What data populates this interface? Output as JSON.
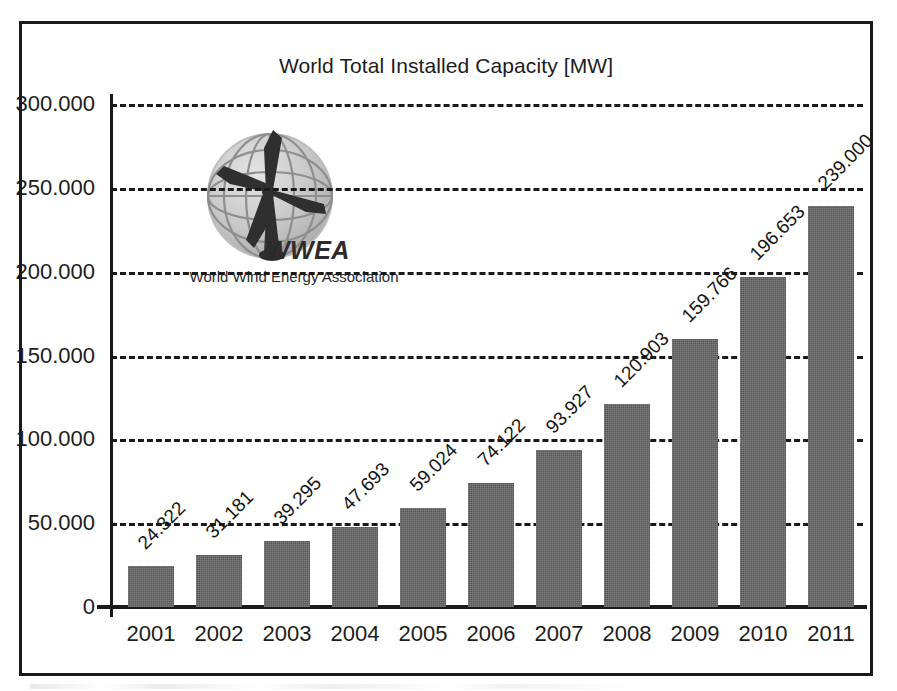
{
  "chart_data": {
    "type": "bar",
    "title": "World Total Installed Capacity [MW]",
    "xlabel": "",
    "ylabel": "",
    "grid": true,
    "legend": "none",
    "ylim": [
      0,
      300000
    ],
    "ytick_step": 50000,
    "ytick_labels": [
      "0",
      "50.000",
      "100.000",
      "150.000",
      "200.000",
      "250.000",
      "300.000"
    ],
    "ytick_values": [
      0,
      50000,
      100000,
      150000,
      200000,
      250000,
      300000
    ],
    "categories": [
      "2001",
      "2002",
      "2003",
      "2004",
      "2005",
      "2006",
      "2007",
      "2008",
      "2009",
      "2010",
      "2011"
    ],
    "values": [
      24322,
      31181,
      39295,
      47693,
      59024,
      74122,
      93927,
      120903,
      159766,
      196653,
      239000
    ],
    "value_labels": [
      "24.322",
      "31.181",
      "39.295",
      "47.693",
      "59.024",
      "74.122",
      "93.927",
      "120.903",
      "159.766",
      "196.653",
      "239.000"
    ],
    "bar_color": "#585858",
    "axis_color": "#1a1a1a",
    "value_label_rotation_deg": -45
  },
  "logo": {
    "wordmark": "WWEA",
    "tagline": "World Wind Energy Association",
    "globe_icon": "globe-icon",
    "turbine_icon": "wind-turbine-icon"
  }
}
